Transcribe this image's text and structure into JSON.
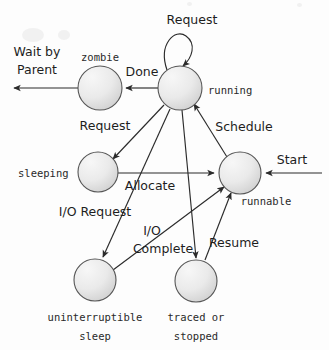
{
  "diagram": {
    "type": "state-diagram",
    "colors": {
      "node_fill_light": "#f2f2f2",
      "node_fill_dark": "#d8d8d8",
      "node_stroke": "#555555",
      "edge": "#2b2b2b",
      "text": "#1a1a1a",
      "background": "#fdfdfd"
    },
    "states": [
      {
        "id": "zombie",
        "label": "zombie",
        "cx": 100,
        "cy": 88,
        "r": 22,
        "label_x": 100,
        "label_y": 57,
        "label_align": "center"
      },
      {
        "id": "running",
        "label": "running",
        "cx": 180,
        "cy": 88,
        "r": 22,
        "label_x": 208,
        "label_y": 91,
        "label_align": "left"
      },
      {
        "id": "sleeping",
        "label": "sleeping",
        "cx": 98,
        "cy": 172,
        "r": 20,
        "label_x": 72,
        "label_y": 174,
        "label_align": "right"
      },
      {
        "id": "runnable",
        "label": "runnable",
        "cx": 240,
        "cy": 173,
        "r": 21,
        "label_x": 262,
        "label_y": 201,
        "label_align": "center"
      },
      {
        "id": "uninterruptible_sleep",
        "label_line1": "uninterruptible",
        "label_line2": "sleep",
        "cx": 95,
        "cy": 280,
        "r": 21,
        "label_x": 95,
        "label_y": 318,
        "label_align": "center"
      },
      {
        "id": "traced_or_stopped",
        "label_line1": "traced or",
        "label_line2": "stopped",
        "cx": 196,
        "cy": 281,
        "r": 21,
        "label_x": 196,
        "label_y": 318,
        "label_align": "center"
      }
    ],
    "transitions": [
      {
        "id": "running-self",
        "label": "Request",
        "from": "running",
        "to": "running",
        "label_x": 180,
        "label_y": 20
      },
      {
        "id": "running-zombie",
        "label": "Done",
        "from": "running",
        "to": "zombie",
        "label_x": 144,
        "label_y": 72
      },
      {
        "id": "zombie-exit",
        "label_line1": "Wait by",
        "label_line2": "Parent",
        "from": "zombie",
        "to": "exit",
        "label_x": 37,
        "label_y": 52
      },
      {
        "id": "running-sleeping",
        "label": "Request",
        "from": "running",
        "to": "sleeping",
        "label_x": 105,
        "label_y": 126
      },
      {
        "id": "runnable-running",
        "label": "Schedule",
        "from": "runnable",
        "to": "running",
        "label_x": 243,
        "label_y": 127
      },
      {
        "id": "sleeping-runnable",
        "label": "Allocate",
        "from": "sleeping",
        "to": "runnable",
        "label_x": 150,
        "label_y": 185
      },
      {
        "id": "start-runnable",
        "label": "Start",
        "from": "start",
        "to": "runnable",
        "label_x": 292,
        "label_y": 163
      },
      {
        "id": "running-uninterruptible",
        "label": "I/O Request",
        "from": "running",
        "to": "uninterruptible_sleep",
        "label_x": 95,
        "label_y": 212
      },
      {
        "id": "uninterruptible-runnable",
        "label_line1": "I/O",
        "label_line2": "Complete",
        "from": "uninterruptible_sleep",
        "to": "runnable",
        "label_x": 160,
        "label_y": 231
      },
      {
        "id": "running-traced",
        "label": "",
        "from": "running",
        "to": "traced_or_stopped"
      },
      {
        "id": "traced-runnable",
        "label": "Resume",
        "from": "traced_or_stopped",
        "to": "runnable",
        "label_x": 232,
        "label_y": 243
      }
    ]
  }
}
